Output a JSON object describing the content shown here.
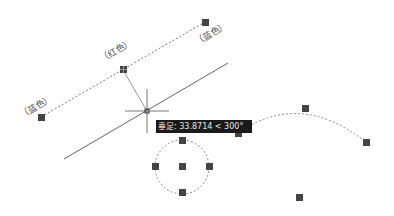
{
  "app": "CAD drawing canvas",
  "labels": {
    "top_right": "（蓝色）",
    "middle": "（红色）",
    "left": "（蓝色）"
  },
  "tooltip": {
    "text": "垂足: 33.8714 < 300°"
  },
  "colors": {
    "background": "#ffffff",
    "grip": "#444444",
    "line": "#555555",
    "tooltip_bg": "#1a1a1a",
    "tooltip_fg": "#e8e8e8"
  },
  "objects": {
    "dotted_line": {
      "start": [
        41,
        117
      ],
      "mid": [
        123,
        70
      ],
      "end": [
        205,
        22
      ]
    },
    "main_line": {
      "start": [
        64,
        159
      ],
      "end": [
        228,
        63
      ]
    },
    "crosshair": {
      "x": 147,
      "y": 111
    },
    "circle": {
      "center": [
        182,
        167
      ],
      "radius": 27
    },
    "arc": {
      "start": [
        238,
        133
      ],
      "mid": [
        305,
        108
      ],
      "end": [
        366,
        142
      ]
    },
    "extra_grip": [
      299,
      197
    ]
  }
}
